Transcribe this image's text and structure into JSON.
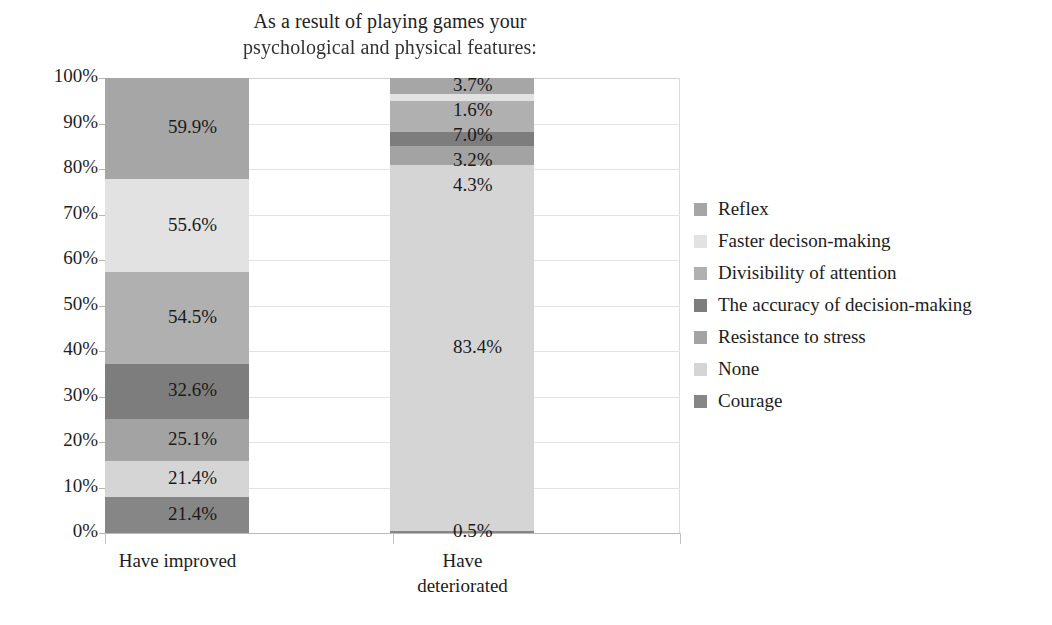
{
  "chart_data": {
    "type": "bar",
    "subtype": "100% stacked column",
    "title": "As a result of playing games your psychological and physical features:",
    "title_lines": [
      "As a result of playing games your",
      "psychological and physical features:"
    ],
    "xlabel": "",
    "ylabel": "",
    "categories": [
      "Have improved",
      "Have deteriorated"
    ],
    "category_label_lines": [
      [
        "Have improved"
      ],
      [
        "Have",
        "deteriorated"
      ]
    ],
    "ylim": [
      0,
      100
    ],
    "ytick_labels": [
      "0%",
      "10%",
      "20%",
      "30%",
      "40%",
      "50%",
      "60%",
      "70%",
      "80%",
      "90%",
      "100%"
    ],
    "ytick_values": [
      0,
      10,
      20,
      30,
      40,
      50,
      60,
      70,
      80,
      90,
      100
    ],
    "grid": true,
    "legend_position": "right",
    "series": [
      {
        "name": "Reflex",
        "color": "#a6a6a6",
        "values": [
          59.9,
          3.7
        ],
        "labels": [
          "59.9%",
          "3.7%"
        ]
      },
      {
        "name": "Faster decison-making",
        "color": "#e2e2e2",
        "values": [
          55.6,
          1.6
        ],
        "labels": [
          "55.6%",
          "1.6%"
        ]
      },
      {
        "name": "Divisibility of attention",
        "color": "#b0b0b0",
        "values": [
          54.5,
          7.0
        ],
        "labels": [
          "54.5%",
          "7.0%"
        ]
      },
      {
        "name": "The accuracy of decision-making",
        "color": "#7d7d7d",
        "values": [
          32.6,
          3.2
        ],
        "labels": [
          "32.6%",
          "3.2%"
        ]
      },
      {
        "name": "Resistance to stress",
        "color": "#a3a3a3",
        "values": [
          25.1,
          4.3
        ],
        "labels": [
          "25.1%",
          "4.3%"
        ]
      },
      {
        "name": "None",
        "color": "#d5d5d5",
        "values": [
          21.4,
          83.4
        ],
        "labels": [
          "21.4%",
          "83.4%"
        ]
      },
      {
        "name": "Courage",
        "color": "#868686",
        "values": [
          21.4,
          0.5
        ],
        "labels": [
          "21.4%",
          "0.5%"
        ]
      }
    ]
  }
}
